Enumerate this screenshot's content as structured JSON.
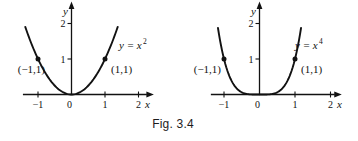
{
  "figure": {
    "caption": "Fig. 3.4"
  },
  "colors": {
    "ink": "#121212",
    "background": "#ffffff"
  },
  "chart_data": [
    {
      "type": "line",
      "title": "y = x^2",
      "equation_base": "y = x",
      "equation_exponent": "2",
      "exponent": 2,
      "xlabel": "x",
      "ylabel": "y",
      "xlim": [
        -1.45,
        2.25
      ],
      "ylim": [
        0,
        2.42
      ],
      "grid": false,
      "x_ticks": [
        -1,
        0,
        1,
        2
      ],
      "x_tick_labels": [
        "−1",
        "0",
        "1",
        "2"
      ],
      "y_ticks": [
        1,
        2
      ],
      "y_tick_labels": [
        "1",
        "2"
      ],
      "curve_x_range": [
        -1.38,
        1.38
      ],
      "points": [
        {
          "x": -1,
          "y": 1,
          "label": "(−1,1)"
        },
        {
          "x": 1,
          "y": 1,
          "label": "(1,1)"
        }
      ],
      "samples": {
        "x": [
          -1.4,
          -1.2,
          -1,
          -0.8,
          -0.6,
          -0.4,
          -0.2,
          0,
          0.2,
          0.4,
          0.6,
          0.8,
          1,
          1.2,
          1.4
        ],
        "y": [
          1.96,
          1.44,
          1,
          0.64,
          0.36,
          0.16,
          0.04,
          0,
          0.04,
          0.16,
          0.36,
          0.64,
          1,
          1.44,
          1.96
        ]
      }
    },
    {
      "type": "line",
      "title": "y = x^4",
      "equation_base": "y = x",
      "equation_exponent": "4",
      "exponent": 4,
      "xlabel": "x",
      "ylabel": "y",
      "xlim": [
        -1.37,
        2.12
      ],
      "ylim": [
        0,
        2.42
      ],
      "grid": false,
      "x_ticks": [
        -1,
        0,
        1,
        2
      ],
      "x_tick_labels": [
        "−1",
        "0",
        "1",
        "2"
      ],
      "y_ticks": [
        1,
        2
      ],
      "y_tick_labels": [
        "1",
        "2"
      ],
      "curve_x_range": [
        -1.17,
        1.17
      ],
      "points": [
        {
          "x": -1,
          "y": 1,
          "label": "(−1,1)"
        },
        {
          "x": 1,
          "y": 1,
          "label": "(1,1)"
        }
      ],
      "samples": {
        "x": [
          -1.15,
          -1,
          -0.8,
          -0.6,
          -0.4,
          -0.2,
          0,
          0.2,
          0.4,
          0.6,
          0.8,
          1,
          1.15
        ],
        "y": [
          1.75,
          1,
          0.41,
          0.13,
          0.026,
          0.002,
          0,
          0.002,
          0.026,
          0.13,
          0.41,
          1,
          1.75
        ]
      }
    }
  ]
}
